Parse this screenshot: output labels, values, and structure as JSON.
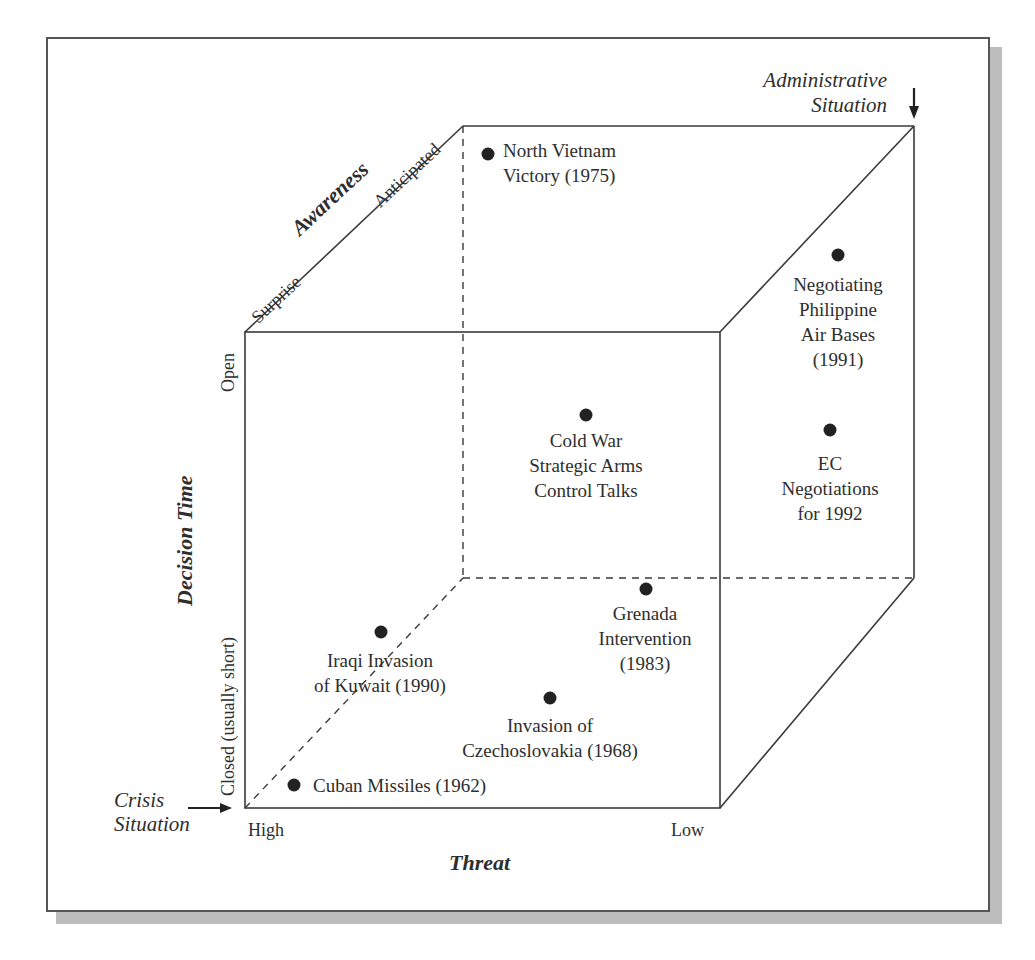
{
  "figure": {
    "axes": {
      "awareness": {
        "title": "Awareness",
        "low": "Surprise",
        "high": "Anticipated"
      },
      "decision_time": {
        "title": "Decision Time",
        "low": "Closed (usually short)",
        "high": "Open"
      },
      "threat": {
        "title": "Threat",
        "high": "High",
        "low": "Low"
      }
    },
    "corners": {
      "crisis": {
        "line1": "Crisis",
        "line2": "Situation",
        "arrow": "right-arrow"
      },
      "administrative": {
        "line1": "Administrative",
        "line2": "Situation",
        "arrow": "down-arrow"
      }
    },
    "points": [
      {
        "id": "cuban",
        "lines": [
          "Cuban Missiles (1962)"
        ]
      },
      {
        "id": "iraqi",
        "lines": [
          "Iraqi Invasion",
          "of Kuwait (1990)"
        ]
      },
      {
        "id": "czech",
        "lines": [
          "Invasion of",
          "Czechoslovakia (1968)"
        ]
      },
      {
        "id": "grenada",
        "lines": [
          "Grenada",
          "Intervention",
          "(1983)"
        ]
      },
      {
        "id": "coldwar",
        "lines": [
          "Cold War",
          "Strategic Arms",
          "Control Talks"
        ]
      },
      {
        "id": "ec",
        "lines": [
          "EC",
          "Negotiations",
          "for 1992"
        ]
      },
      {
        "id": "philippine",
        "lines": [
          "Negotiating",
          "Philippine",
          "Air Bases",
          "(1991)"
        ]
      },
      {
        "id": "northvietnam",
        "lines": [
          "North Vietnam",
          "Victory (1975)"
        ]
      }
    ],
    "colors": {
      "line": "#3a3a3a",
      "dot": "#222222",
      "shadow": "#bdbdbd"
    }
  }
}
